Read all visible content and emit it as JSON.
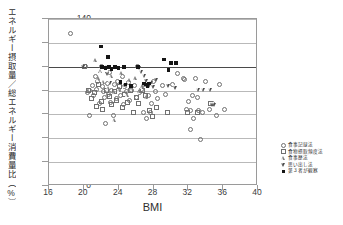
{
  "chart_data": {
    "type": "scatter",
    "title": "",
    "xlabel": "BMI",
    "ylabel": "エネルギー摂取量／総エネルギー消費量比（%）",
    "xlim": [
      16,
      40
    ],
    "ylim": [
      0,
      140
    ],
    "xticks": [
      16,
      20,
      24,
      28,
      32,
      36,
      40
    ],
    "yticks": [
      0,
      20,
      40,
      60,
      80,
      100,
      120,
      140
    ],
    "grid": "horizontal",
    "reference_line": {
      "y": 100,
      "label": "100%"
    },
    "legend_position": "outside-right-bottom",
    "series": [
      {
        "name": "食事記録法",
        "marker": "open-circle",
        "points": [
          [
            18.5,
            128
          ],
          [
            20.2,
            100
          ],
          [
            20.4,
            78.5
          ],
          [
            20.6,
            80
          ],
          [
            20.7,
            59.5
          ],
          [
            21.0,
            84
          ],
          [
            21.1,
            76
          ],
          [
            21.3,
            92
          ],
          [
            21.4,
            81
          ],
          [
            21.6,
            88
          ],
          [
            21.8,
            69
          ],
          [
            22.0,
            100
          ],
          [
            22.1,
            83
          ],
          [
            22.3,
            79
          ],
          [
            22.4,
            74
          ],
          [
            22.5,
            52.5
          ],
          [
            22.7,
            86
          ],
          [
            22.8,
            77
          ],
          [
            23.0,
            95
          ],
          [
            23.1,
            70
          ],
          [
            23.2,
            80
          ],
          [
            23.4,
            59.5
          ],
          [
            23.5,
            85
          ],
          [
            23.7,
            73
          ],
          [
            23.9,
            88
          ],
          [
            24.0,
            81
          ],
          [
            24.2,
            76
          ],
          [
            24.4,
            92
          ],
          [
            24.5,
            68
          ],
          [
            24.7,
            83
          ],
          [
            24.9,
            79
          ],
          [
            25.1,
            87
          ],
          [
            25.3,
            72
          ],
          [
            25.5,
            80
          ],
          [
            25.8,
            84
          ],
          [
            26.0,
            74
          ],
          [
            26.2,
            100
          ],
          [
            26.4,
            78
          ],
          [
            26.6,
            81
          ],
          [
            26.8,
            62
          ],
          [
            27.0,
            85
          ],
          [
            27.2,
            57
          ],
          [
            27.4,
            76
          ],
          [
            27.6,
            62
          ],
          [
            27.8,
            69
          ],
          [
            28.0,
            88
          ],
          [
            28.2,
            79
          ],
          [
            28.5,
            73
          ],
          [
            29.0,
            84
          ],
          [
            29.4,
            77
          ],
          [
            30.2,
            85
          ],
          [
            30.8,
            94
          ],
          [
            31.4,
            90
          ],
          [
            31.6,
            89
          ],
          [
            31.8,
            64
          ],
          [
            32.0,
            71
          ],
          [
            32.2,
            63
          ],
          [
            32.3,
            47
          ],
          [
            32.5,
            76
          ],
          [
            32.6,
            57
          ],
          [
            32.8,
            90
          ],
          [
            33.0,
            74
          ],
          [
            33.2,
            63
          ],
          [
            33.4,
            39
          ],
          [
            33.6,
            62
          ],
          [
            34.0,
            88
          ],
          [
            34.4,
            64
          ],
          [
            34.8,
            69
          ],
          [
            35.2,
            59
          ],
          [
            35.6,
            85
          ],
          [
            36.2,
            64
          ]
        ]
      },
      {
        "name": "食物摂取頻度法",
        "marker": "open-square",
        "points": [
          [
            20.1,
            100
          ],
          [
            20.5,
            80
          ],
          [
            20.9,
            73
          ],
          [
            21.2,
            78
          ],
          [
            21.5,
            67
          ],
          [
            21.7,
            85
          ],
          [
            22.0,
            71
          ],
          [
            22.2,
            64
          ],
          [
            22.6,
            80
          ],
          [
            22.9,
            75
          ],
          [
            23.2,
            68
          ],
          [
            23.5,
            79
          ],
          [
            23.8,
            72
          ],
          [
            24.1,
            83
          ],
          [
            24.4,
            66
          ],
          [
            24.7,
            77
          ],
          [
            25.0,
            70
          ],
          [
            25.4,
            80
          ],
          [
            25.7,
            62
          ],
          [
            26.0,
            74
          ],
          [
            26.3,
            69
          ],
          [
            26.7,
            80
          ],
          [
            27.1,
            76
          ],
          [
            27.5,
            63
          ],
          [
            27.9,
            58
          ],
          [
            28.3,
            66
          ],
          [
            29.6,
            62
          ],
          [
            31.9,
            62
          ],
          [
            33.1,
            62
          ],
          [
            34.6,
            69
          ]
        ]
      },
      {
        "name": "食事歴法",
        "marker": "open-triangle",
        "points": [
          [
            21.4,
            105
          ],
          [
            21.7,
            90
          ],
          [
            22.0,
            96
          ],
          [
            22.3,
            87
          ],
          [
            22.6,
            99
          ],
          [
            22.9,
            82
          ],
          [
            23.2,
            92
          ],
          [
            23.5,
            78
          ],
          [
            23.8,
            86
          ],
          [
            23.6,
            55
          ],
          [
            24.1,
            80
          ],
          [
            24.4,
            94
          ],
          [
            24.7,
            84
          ],
          [
            25.0,
            76
          ],
          [
            25.3,
            88
          ],
          [
            25.6,
            81
          ],
          [
            26.0,
            90
          ],
          [
            26.4,
            79
          ],
          [
            26.8,
            83
          ],
          [
            27.2,
            74
          ]
        ]
      },
      {
        "name": "思い出し法",
        "marker": "open-down-triangle",
        "points": [
          [
            20.0,
            100
          ],
          [
            22.8,
            94
          ],
          [
            23.1,
            86
          ],
          [
            26.4,
            99
          ],
          [
            26.7,
            95
          ],
          [
            27.0,
            92
          ],
          [
            27.2,
            88
          ],
          [
            27.4,
            85
          ],
          [
            27.6,
            84
          ],
          [
            27.8,
            86
          ],
          [
            28.0,
            83
          ],
          [
            28.4,
            89
          ],
          [
            29.8,
            84
          ],
          [
            30.6,
            82
          ],
          [
            33.2,
            80
          ],
          [
            33.8,
            80
          ],
          [
            34.6,
            80
          ],
          [
            34.8,
            68
          ],
          [
            35.0,
            68
          ]
        ]
      },
      {
        "name": "第３者が観察",
        "marker": "filled-square",
        "points": [
          [
            22.0,
            117
          ],
          [
            22.8,
            108
          ],
          [
            22.1,
            100
          ],
          [
            22.5,
            99
          ],
          [
            22.9,
            100
          ],
          [
            23.2,
            98
          ],
          [
            23.6,
            100
          ],
          [
            24.0,
            99
          ],
          [
            24.6,
            100
          ],
          [
            24.2,
            87
          ],
          [
            24.8,
            85
          ],
          [
            25.4,
            84
          ],
          [
            26.2,
            100
          ],
          [
            26.9,
            86
          ],
          [
            27.1,
            85
          ],
          [
            27.3,
            84
          ],
          [
            27.5,
            86
          ],
          [
            29.2,
            106
          ],
          [
            29.7,
            97
          ],
          [
            30.0,
            103
          ],
          [
            30.6,
            103
          ]
        ]
      }
    ]
  }
}
